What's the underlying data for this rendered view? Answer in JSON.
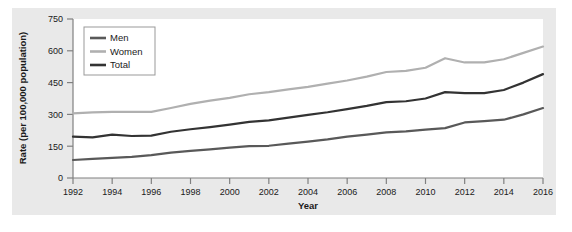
{
  "chart_data": {
    "type": "line",
    "title": "",
    "xlabel": "Year",
    "ylabel": "Rate (per 100,000 population)",
    "xlim": [
      1992,
      2016
    ],
    "ylim": [
      0,
      750
    ],
    "yticks": [
      0,
      150,
      300,
      450,
      600,
      750
    ],
    "ytick_labels": [
      "0",
      "150",
      "300",
      "450",
      "600",
      "750"
    ],
    "xticks": [
      1992,
      1994,
      1996,
      1998,
      2000,
      2002,
      2004,
      2006,
      2008,
      2010,
      2012,
      2014,
      2016
    ],
    "xtick_labels": [
      "1992",
      "1994",
      "1996",
      "1998",
      "2000",
      "2002",
      "2004",
      "2006",
      "2008",
      "2010",
      "2012",
      "2014",
      "2016"
    ],
    "grid": false,
    "legend_position": "upper-left",
    "x": [
      1992,
      1993,
      1994,
      1995,
      1996,
      1997,
      1998,
      1999,
      2000,
      2001,
      2002,
      2003,
      2004,
      2005,
      2006,
      2007,
      2008,
      2009,
      2010,
      2011,
      2012,
      2013,
      2014,
      2015,
      2016
    ],
    "series": [
      {
        "name": "Men",
        "color": "#595959",
        "values": [
          85,
          90,
          95,
          100,
          108,
          120,
          128,
          135,
          143,
          150,
          152,
          162,
          172,
          182,
          195,
          205,
          215,
          220,
          228,
          235,
          262,
          268,
          275,
          300,
          330
        ]
      },
      {
        "name": "Women",
        "color": "#b0b0b0",
        "values": [
          305,
          310,
          312,
          312,
          312,
          330,
          350,
          365,
          378,
          395,
          405,
          418,
          430,
          445,
          460,
          478,
          500,
          505,
          520,
          565,
          545,
          545,
          560,
          590,
          620
        ]
      },
      {
        "name": "Total",
        "color": "#333333",
        "values": [
          195,
          192,
          205,
          198,
          200,
          218,
          230,
          240,
          252,
          265,
          272,
          285,
          298,
          310,
          325,
          340,
          358,
          362,
          375,
          405,
          400,
          400,
          415,
          450,
          490
        ]
      }
    ]
  },
  "legend": {
    "items": [
      {
        "label": "Men"
      },
      {
        "label": "Women"
      },
      {
        "label": "Total"
      }
    ]
  },
  "colors": {
    "panel_background": "#e9e9e9",
    "plot_background": "#ffffff",
    "axis": "#808080",
    "text": "#1a1a1a"
  }
}
